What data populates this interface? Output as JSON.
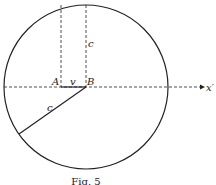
{
  "figure": {
    "caption": "Fig. 5",
    "labels": {
      "A": "A",
      "B": "B",
      "v": "v",
      "c_vertical": "c",
      "c_radius": "c",
      "axis": "x′"
    }
  }
}
